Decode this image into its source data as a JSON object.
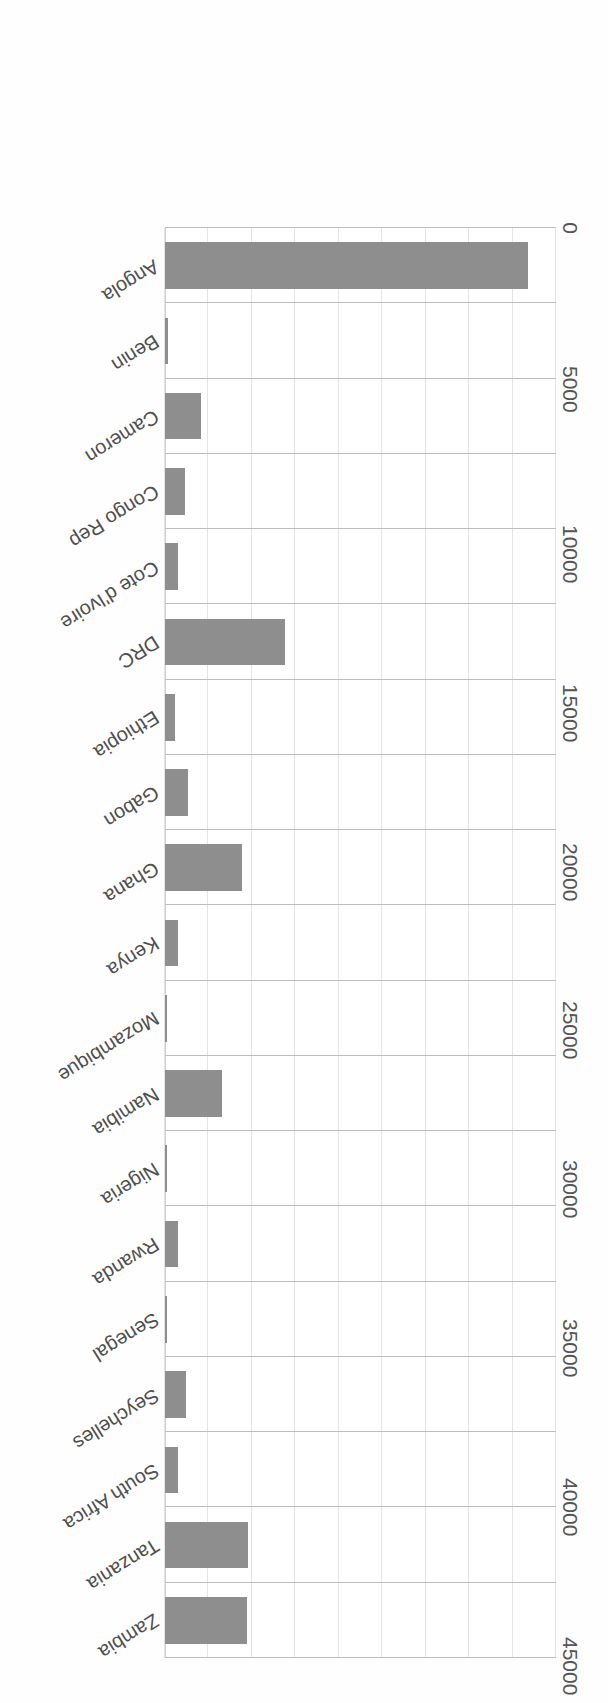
{
  "chart_data": {
    "type": "bar",
    "orientation": "horizontal",
    "title": "",
    "xlabel": "",
    "ylabel": "US Million Dollars",
    "value_axis_label": "US Million Dollars",
    "tick_labels": [
      "45000",
      "40000",
      "35000",
      "30000",
      "25000",
      "20000",
      "15000",
      "10000",
      "5000",
      "0"
    ],
    "tick_values": [
      45000,
      40000,
      35000,
      30000,
      25000,
      20000,
      15000,
      10000,
      5000,
      0
    ],
    "ylim": [
      0,
      45000
    ],
    "grid": true,
    "legend": "none",
    "bar_color": "#8e8e8e",
    "gridline_color": "#e4e4e4",
    "separator_color": "#bdbdbd",
    "orientation_note": "figure rendered upside-down (page scanned rotated 180 degrees)",
    "categories": [
      "Zambia",
      "Tanzania",
      "South Africa",
      "Seychelles",
      "Senegal",
      "Rwanda",
      "Nigeria",
      "Namibia",
      "Mozambique",
      "Kenya",
      "Ghana",
      "Gabon",
      "Ethiopia",
      "DRC",
      "Cote d'Ivoire",
      "Congo Rep",
      "Cameron",
      "Benin",
      "Angola"
    ],
    "values": [
      9400,
      9600,
      1450,
      2400,
      250,
      1500,
      200,
      6600,
      250,
      1500,
      8900,
      2700,
      1200,
      13800,
      1550,
      2300,
      4200,
      400,
      41800
    ]
  }
}
